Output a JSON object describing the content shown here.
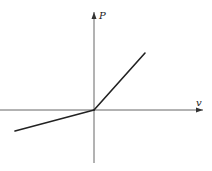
{
  "diagram": {
    "type": "piecewise-linear-graph",
    "axes": {
      "x_label": "v",
      "y_label": "P",
      "origin": {
        "x": 94,
        "y": 110
      }
    },
    "colors": {
      "axis": "#555555",
      "curve": "#222222",
      "background": "#ffffff"
    },
    "curve": {
      "segments": [
        {
          "name": "negative-v-branch",
          "from": [
            15,
            131
          ],
          "to": [
            94,
            110
          ]
        },
        {
          "name": "positive-v-branch",
          "from": [
            94,
            110
          ],
          "to": [
            145,
            53
          ]
        }
      ]
    }
  }
}
